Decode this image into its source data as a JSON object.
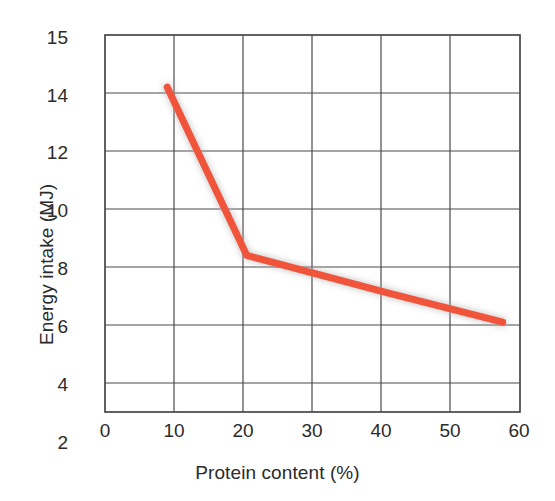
{
  "chart_data": {
    "type": "line",
    "title": "",
    "xlabel": "Protein content (%)",
    "ylabel": "Energy intake (MJ)",
    "xlim": [
      0,
      60
    ],
    "ylim": [
      2,
      15
    ],
    "xticks": [
      0,
      10,
      20,
      30,
      40,
      50,
      60
    ],
    "yticks": [
      2,
      4,
      6,
      8,
      10,
      12,
      14,
      15
    ],
    "xtick_labels": [
      "0",
      "10",
      "20",
      "30",
      "40",
      "50",
      "60"
    ],
    "ytick_labels": [
      "2",
      "4",
      "6",
      "8",
      "10",
      "12",
      "14",
      "15"
    ],
    "grid": true,
    "legend": "none",
    "series": [
      {
        "name": "Energy intake",
        "color": "#f0543a",
        "line_width": 7,
        "x": [
          9.0,
          20.5,
          41.0,
          57.5
        ],
        "y": [
          13.2,
          7.4,
          6.1,
          5.1
        ],
        "points": [
          {
            "x": 9.0,
            "y": 13.2
          },
          {
            "x": 20.5,
            "y": 7.4
          },
          {
            "x": 41.0,
            "y": 6.1
          },
          {
            "x": 57.5,
            "y": 5.1
          }
        ]
      }
    ],
    "annotations": [],
    "style": {
      "axis_color": "#3a3a3a",
      "grid_color": "#4a4a4a",
      "background": "#ffffff",
      "line_shadow": "#808080"
    }
  }
}
